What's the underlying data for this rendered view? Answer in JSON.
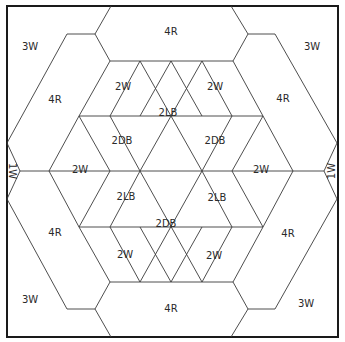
{
  "diagram": {
    "type": "quilt-block-template",
    "legend_codes": {
      "W": "white",
      "R": "red",
      "LB": "light blue",
      "DB": "dark blue"
    },
    "labels": {
      "corner_top_left": "3W",
      "corner_top_right": "3W",
      "corner_bottom_left": "3W",
      "corner_bottom_right": "3W",
      "side_left": "1W",
      "side_right": "1W",
      "ring_top": "4R",
      "ring_bottom": "4R",
      "ring_upper_left": "4R",
      "ring_upper_right": "4R",
      "ring_lower_left": "4R",
      "ring_lower_right": "4R",
      "white_upper_left": "2W",
      "white_upper_right": "2W",
      "white_left": "2W",
      "white_right": "2W",
      "white_lower_left": "2W",
      "white_lower_right": "2W",
      "diamond_top": "2LB",
      "diamond_upper_left": "2DB",
      "diamond_upper_right": "2DB",
      "diamond_lower_left": "2LB",
      "diamond_lower_right": "2LB",
      "diamond_bottom": "2DB"
    }
  }
}
